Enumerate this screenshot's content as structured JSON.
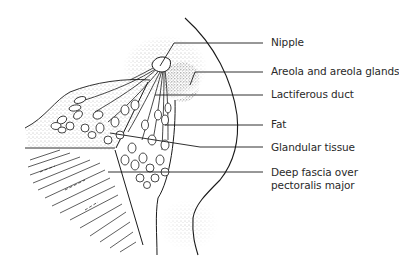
{
  "figure": {
    "labels": [
      {
        "id": "nipple",
        "text": "Nipple",
        "y": 42
      },
      {
        "id": "areola",
        "text": "Areola and areola glands",
        "y": 72
      },
      {
        "id": "lactiferous-duct",
        "text": "Lactiferous duct",
        "y": 94
      },
      {
        "id": "fat",
        "text": "Fat",
        "y": 125
      },
      {
        "id": "glandular-tissue",
        "text": "Glandular tissue",
        "y": 147
      },
      {
        "id": "deep-fascia",
        "text": "Deep fascia over",
        "text2": "pectoralis major",
        "y": 172
      }
    ]
  },
  "colors": {
    "line": "#1a1a1a",
    "stipple": "#555555",
    "text": "#2a2a2a",
    "background": "#ffffff"
  }
}
